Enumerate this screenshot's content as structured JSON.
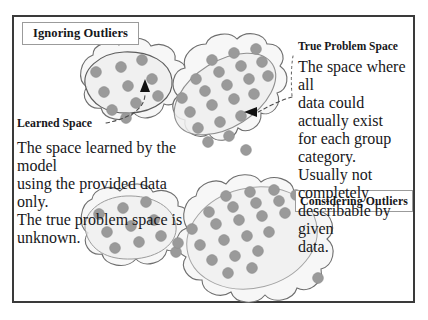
{
  "figure": {
    "title_boxes": {
      "ignoring": "Ignoring Outliers",
      "considering": "Considering Outliers"
    },
    "callouts": {
      "true_problem_space": {
        "heading": "True Problem Space",
        "lines": [
          "The space where all",
          "data could actually exist",
          "for each group category.",
          "Usually not completely",
          "describable by given",
          "data."
        ]
      },
      "learned_space": {
        "heading": "Learned Space",
        "lines": [
          "The space learned by the model",
          "using the provided data only.",
          "The true problem space is",
          "unknown."
        ]
      }
    },
    "colors": {
      "frame": "#3a3a3a",
      "dot_fill": "#9a9a9a",
      "dot_stroke": "#8d8d8d",
      "cloud_stroke": "#6e6e6e",
      "cloud_fill": "#f7f7f7",
      "learned_stroke": "#b9b9b9",
      "learned_fill": "#efefef",
      "leader_line": "#4a4a4a",
      "text": "#17171a",
      "label_border": "#9b9b9b"
    },
    "icons": {
      "arrow_up": "triangle-up-arrowhead",
      "arrow_left": "triangle-left-arrowhead"
    },
    "clusters": {
      "top_left": {
        "name": "ignoring-cluster-left",
        "dots": [
          [
            96,
            72
          ],
          [
            121,
            67
          ],
          [
            142,
            60
          ],
          [
            104,
            92
          ],
          [
            128,
            86
          ],
          [
            152,
            79
          ],
          [
            112,
            110
          ],
          [
            136,
            103
          ],
          [
            158,
            96
          ],
          [
            126,
            118
          ]
        ]
      },
      "top_right": {
        "name": "ignoring-cluster-right",
        "dots": [
          [
            212,
            60
          ],
          [
            234,
            53
          ],
          [
            256,
            49
          ],
          [
            196,
            79
          ],
          [
            219,
            72
          ],
          [
            241,
            66
          ],
          [
            262,
            62
          ],
          [
            182,
            98
          ],
          [
            205,
            91
          ],
          [
            227,
            85
          ],
          [
            249,
            79
          ],
          [
            268,
            76
          ],
          [
            190,
            112
          ],
          [
            212,
            105
          ],
          [
            234,
            99
          ],
          [
            254,
            94
          ],
          [
            198,
            128
          ],
          [
            220,
            122
          ],
          [
            241,
            116
          ],
          [
            208,
            142
          ],
          [
            229,
            136
          ],
          [
            246,
            150
          ],
          [
            266,
            44
          ]
        ]
      },
      "bottom_left": {
        "name": "considering-cluster-left",
        "dots": [
          [
            99,
            214
          ],
          [
            123,
            208
          ],
          [
            146,
            202
          ],
          [
            107,
            232
          ],
          [
            131,
            226
          ],
          [
            154,
            220
          ],
          [
            115,
            248
          ],
          [
            139,
            242
          ],
          [
            161,
            236
          ],
          [
            176,
            252
          ]
        ]
      },
      "bottom_right": {
        "name": "considering-cluster-right",
        "dots": [
          [
            226,
            196
          ],
          [
            250,
            192
          ],
          [
            274,
            190
          ],
          [
            296,
            195
          ],
          [
            209,
            212
          ],
          [
            233,
            207
          ],
          [
            256,
            203
          ],
          [
            279,
            201
          ],
          [
            192,
            229
          ],
          [
            216,
            224
          ],
          [
            239,
            220
          ],
          [
            262,
            216
          ],
          [
            285,
            213
          ],
          [
            200,
            245
          ],
          [
            224,
            240
          ],
          [
            247,
            236
          ],
          [
            269,
            232
          ],
          [
            212,
            260
          ],
          [
            235,
            256
          ],
          [
            258,
            251
          ],
          [
            228,
            273
          ],
          [
            252,
            268
          ],
          [
            178,
            243
          ],
          [
            318,
            278
          ]
        ]
      }
    }
  }
}
